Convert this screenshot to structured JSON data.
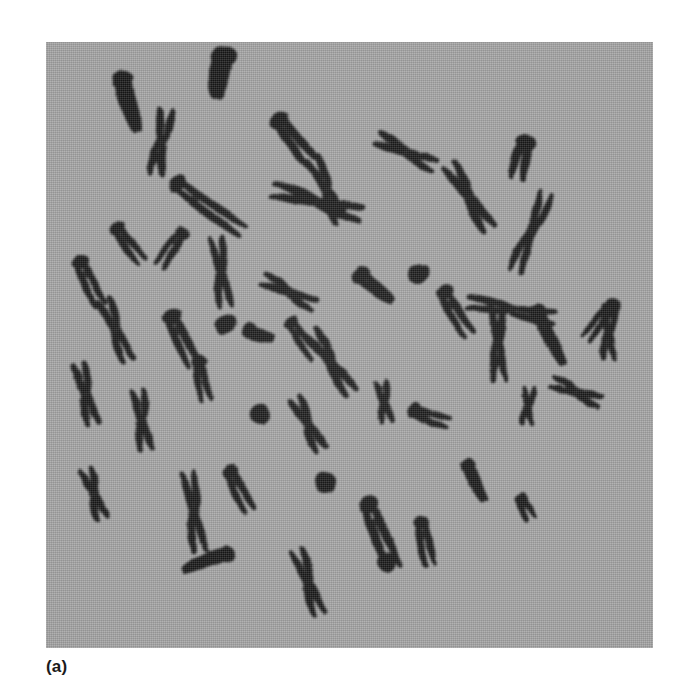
{
  "figure": {
    "caption": "(a)",
    "panel_label": "metaphase-chromosome-spread",
    "background_color": "#a3a3a3",
    "chromosome_color": "#141414",
    "page_background": "#ffffff",
    "panel": {
      "x": 46,
      "y": 42,
      "width": 607,
      "height": 606
    },
    "chromosome_count": 46
  },
  "chart_data": {
    "type": "scatter",
    "subtitle": "(a)",
    "xlabel": "",
    "ylabel": "",
    "xlim": [
      0,
      607
    ],
    "ylim": [
      0,
      606
    ],
    "grid": false,
    "legend": "none",
    "note": "Each point is one stained chromosome in the spread; x/y are pixel positions within the micrograph panel, rot is the long-axis angle in degrees, len and wid are the body dimensions in pixels, and shape describes the morphology (x = metacentric X-shape with visible sister chromatids, v = submetacentric/acrocentric V-shape, rod = nearly telocentric rod, dot = small condensed body).",
    "categories": [
      "x",
      "v",
      "rod",
      "dot"
    ],
    "values": [
      13,
      16,
      13,
      4
    ],
    "series": [
      {
        "name": "chromosomes",
        "points": [
          {
            "id": 1,
            "x": 84,
            "y": 62,
            "rot": -18,
            "len": 62,
            "wid": 19,
            "shape": "rod"
          },
          {
            "id": 2,
            "x": 175,
            "y": 33,
            "rot": 12,
            "len": 52,
            "wid": 23,
            "shape": "rod"
          },
          {
            "id": 3,
            "x": 243,
            "y": 90,
            "rot": -33,
            "len": 60,
            "wid": 18,
            "shape": "v"
          },
          {
            "id": 4,
            "x": 281,
            "y": 148,
            "rot": -28,
            "len": 74,
            "wid": 17,
            "shape": "x"
          },
          {
            "id": 5,
            "x": 150,
            "y": 155,
            "rot": -55,
            "len": 86,
            "wid": 17,
            "shape": "v"
          },
          {
            "id": 6,
            "x": 115,
            "y": 100,
            "rot": 5,
            "len": 70,
            "wid": 17,
            "shape": "x"
          },
          {
            "id": 7,
            "x": 360,
            "y": 110,
            "rot": -62,
            "len": 68,
            "wid": 16,
            "shape": "x"
          },
          {
            "id": 8,
            "x": 478,
            "y": 110,
            "rot": 10,
            "len": 42,
            "wid": 18,
            "shape": "v"
          },
          {
            "id": 9,
            "x": 271,
            "y": 160,
            "rot": -72,
            "len": 96,
            "wid": 18,
            "shape": "x"
          },
          {
            "id": 10,
            "x": 423,
            "y": 155,
            "rot": -29,
            "len": 80,
            "wid": 17,
            "shape": "x"
          },
          {
            "id": 11,
            "x": 485,
            "y": 190,
            "rot": 18,
            "len": 88,
            "wid": 16,
            "shape": "x"
          },
          {
            "id": 12,
            "x": 78,
            "y": 195,
            "rot": -40,
            "len": 46,
            "wid": 14,
            "shape": "v"
          },
          {
            "id": 13,
            "x": 130,
            "y": 200,
            "rot": 33,
            "len": 44,
            "wid": 14,
            "shape": "v"
          },
          {
            "id": 14,
            "x": 40,
            "y": 232,
            "rot": -28,
            "len": 52,
            "wid": 15,
            "shape": "v"
          },
          {
            "id": 15,
            "x": 175,
            "y": 230,
            "rot": -13,
            "len": 74,
            "wid": 16,
            "shape": "x"
          },
          {
            "id": 16,
            "x": 243,
            "y": 250,
            "rot": -68,
            "len": 62,
            "wid": 15,
            "shape": "x"
          },
          {
            "id": 17,
            "x": 330,
            "y": 245,
            "rot": -47,
            "len": 48,
            "wid": 16,
            "shape": "rod"
          },
          {
            "id": 18,
            "x": 372,
            "y": 232,
            "rot": 62,
            "len": 28,
            "wid": 13,
            "shape": "dot"
          },
          {
            "id": 19,
            "x": 405,
            "y": 262,
            "rot": -36,
            "len": 54,
            "wid": 16,
            "shape": "v"
          },
          {
            "id": 20,
            "x": 465,
            "y": 268,
            "rot": -82,
            "len": 92,
            "wid": 16,
            "shape": "x"
          },
          {
            "id": 21,
            "x": 560,
            "y": 272,
            "rot": 35,
            "len": 48,
            "wid": 14,
            "shape": "v"
          },
          {
            "id": 22,
            "x": 70,
            "y": 288,
            "rot": -26,
            "len": 70,
            "wid": 16,
            "shape": "x"
          },
          {
            "id": 23,
            "x": 132,
            "y": 288,
            "rot": -20,
            "len": 58,
            "wid": 17,
            "shape": "v"
          },
          {
            "id": 24,
            "x": 180,
            "y": 282,
            "rot": 52,
            "len": 30,
            "wid": 13,
            "shape": "dot"
          },
          {
            "id": 25,
            "x": 214,
            "y": 292,
            "rot": -72,
            "len": 32,
            "wid": 15,
            "shape": "rod"
          },
          {
            "id": 26,
            "x": 252,
            "y": 290,
            "rot": -36,
            "len": 46,
            "wid": 14,
            "shape": "v"
          },
          {
            "id": 27,
            "x": 155,
            "y": 330,
            "rot": -12,
            "len": 44,
            "wid": 14,
            "shape": "v"
          },
          {
            "id": 28,
            "x": 285,
            "y": 320,
            "rot": -32,
            "len": 78,
            "wid": 17,
            "shape": "x"
          },
          {
            "id": 29,
            "x": 452,
            "y": 300,
            "rot": -6,
            "len": 82,
            "wid": 16,
            "shape": "x"
          },
          {
            "id": 30,
            "x": 505,
            "y": 295,
            "rot": -24,
            "len": 66,
            "wid": 15,
            "shape": "rod"
          },
          {
            "id": 31,
            "x": 563,
            "y": 290,
            "rot": 4,
            "len": 58,
            "wid": 15,
            "shape": "x"
          },
          {
            "id": 32,
            "x": 40,
            "y": 352,
            "rot": -18,
            "len": 66,
            "wid": 16,
            "shape": "x"
          },
          {
            "id": 33,
            "x": 96,
            "y": 378,
            "rot": -8,
            "len": 64,
            "wid": 16,
            "shape": "x"
          },
          {
            "id": 34,
            "x": 214,
            "y": 372,
            "rot": 60,
            "len": 26,
            "wid": 14,
            "shape": "dot"
          },
          {
            "id": 35,
            "x": 262,
            "y": 382,
            "rot": -25,
            "len": 62,
            "wid": 16,
            "shape": "x"
          },
          {
            "id": 36,
            "x": 338,
            "y": 360,
            "rot": -11,
            "len": 44,
            "wid": 14,
            "shape": "x"
          },
          {
            "id": 37,
            "x": 378,
            "y": 372,
            "rot": -66,
            "len": 40,
            "wid": 15,
            "shape": "v"
          },
          {
            "id": 38,
            "x": 482,
            "y": 364,
            "rot": -2,
            "len": 40,
            "wid": 13,
            "shape": "x"
          },
          {
            "id": 39,
            "x": 530,
            "y": 350,
            "rot": -72,
            "len": 56,
            "wid": 15,
            "shape": "x"
          },
          {
            "id": 40,
            "x": 48,
            "y": 452,
            "rot": -24,
            "len": 56,
            "wid": 15,
            "shape": "x"
          },
          {
            "id": 41,
            "x": 148,
            "y": 470,
            "rot": -8,
            "len": 84,
            "wid": 16,
            "shape": "x"
          },
          {
            "id": 42,
            "x": 190,
            "y": 440,
            "rot": -28,
            "len": 48,
            "wid": 15,
            "shape": "v"
          },
          {
            "id": 43,
            "x": 280,
            "y": 440,
            "rot": 55,
            "len": 28,
            "wid": 14,
            "shape": "dot"
          },
          {
            "id": 44,
            "x": 330,
            "y": 480,
            "rot": -24,
            "len": 74,
            "wid": 18,
            "shape": "v"
          },
          {
            "id": 45,
            "x": 378,
            "y": 492,
            "rot": -14,
            "len": 48,
            "wid": 15,
            "shape": "v"
          },
          {
            "id": 46,
            "x": 430,
            "y": 440,
            "rot": -22,
            "len": 46,
            "wid": 14,
            "shape": "rod"
          },
          {
            "id": 47,
            "x": 478,
            "y": 462,
            "rot": -30,
            "len": 26,
            "wid": 13,
            "shape": "v"
          },
          {
            "id": 48,
            "x": 160,
            "y": 520,
            "rot": 70,
            "len": 54,
            "wid": 15,
            "shape": "rod"
          },
          {
            "id": 49,
            "x": 262,
            "y": 540,
            "rot": -16,
            "len": 72,
            "wid": 16,
            "shape": "x"
          },
          {
            "id": 50,
            "x": 340,
            "y": 520,
            "rot": -54,
            "len": 26,
            "wid": 13,
            "shape": "dot"
          }
        ]
      }
    ]
  }
}
